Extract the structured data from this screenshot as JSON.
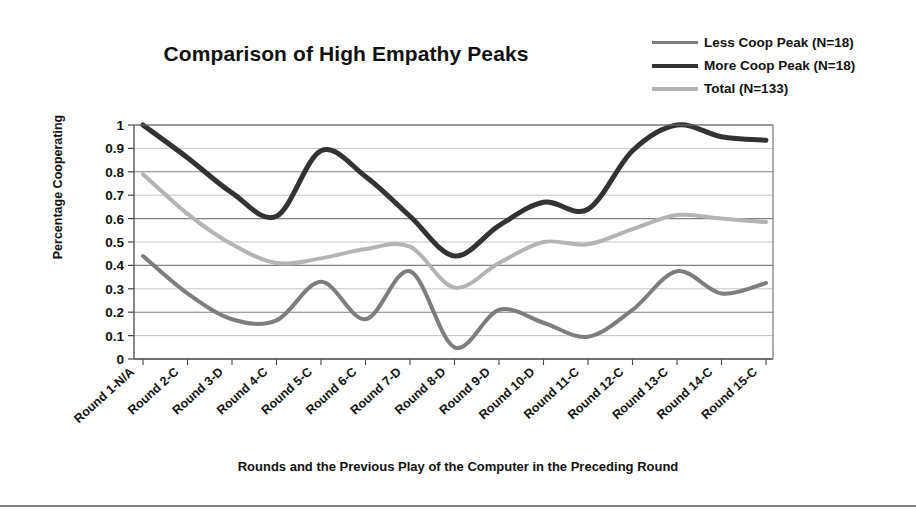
{
  "figure": {
    "title": "Comparison of High Empathy Peaks"
  },
  "legend": {
    "position": "top-right",
    "entries": [
      {
        "label": "Less Coop Peak (N=18)",
        "color": "#7d7d7d"
      },
      {
        "label": "More Coop Peak (N=18)",
        "color": "#333333"
      },
      {
        "label": "Total (N=133)",
        "color": "#b4b4b4"
      }
    ]
  },
  "axes": {
    "y_title": "Percentage Cooperating",
    "x_title": "Rounds and the Previous Play of the Computer in the Preceding Round"
  },
  "chart_data": {
    "type": "line",
    "title": "Comparison of High Empathy Peaks",
    "xlabel": "Rounds and the Previous Play of the Computer in the Preceding Round",
    "ylabel": "Percentage Cooperating",
    "ylim": [
      0,
      1
    ],
    "ytick_labels": [
      "1",
      "0.9",
      "0.8",
      "0.7",
      "0.6",
      "0.5",
      "0.4",
      "0.3",
      "0.2",
      "0.1",
      "0"
    ],
    "ytick_values": [
      1,
      0.9,
      0.8,
      0.7,
      0.6,
      0.5,
      0.4,
      0.3,
      0.2,
      0.1,
      0
    ],
    "grid": true,
    "legend_position": "top-right",
    "categories": [
      "Round 1-N/A",
      "Round 2-C",
      "Round 3-D",
      "Round 4-C",
      "Round 5-C",
      "Round 6-C",
      "Round 7-D",
      "Round 8-D",
      "Round 9-D",
      "Round 10-D",
      "Round 11-C",
      "Round 12-C",
      "Round 13-C",
      "Round 14-C",
      "Round 15-C"
    ],
    "series": [
      {
        "name": "Less Coop Peak (N=18)",
        "color": "#7d7d7d",
        "width": 4,
        "values": [
          0.44,
          0.28,
          0.17,
          0.165,
          0.33,
          0.17,
          0.375,
          0.05,
          0.21,
          0.155,
          0.095,
          0.21,
          0.375,
          0.28,
          0.325
        ]
      },
      {
        "name": "More Coop Peak (N=18)",
        "color": "#333333",
        "width": 5,
        "values": [
          1.0,
          0.86,
          0.71,
          0.61,
          0.89,
          0.78,
          0.61,
          0.44,
          0.57,
          0.67,
          0.64,
          0.89,
          1.0,
          0.95,
          0.935
        ]
      },
      {
        "name": "Total (N=133)",
        "color": "#b4b4b4",
        "width": 4,
        "values": [
          0.79,
          0.62,
          0.49,
          0.41,
          0.43,
          0.47,
          0.48,
          0.305,
          0.41,
          0.5,
          0.49,
          0.555,
          0.615,
          0.6,
          0.585
        ]
      }
    ]
  }
}
